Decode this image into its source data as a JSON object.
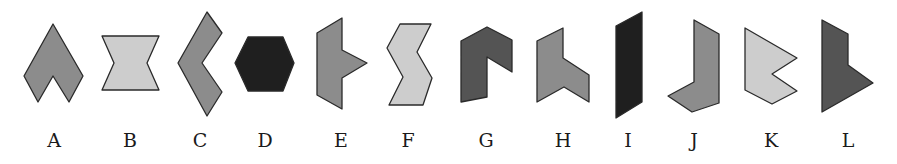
{
  "figure": {
    "title": "",
    "colors": {
      "light": "#cdcdcd",
      "medium": "#8c8c8c",
      "dark": "#545454",
      "black": "#1f1f1f"
    },
    "shapes": [
      {
        "label": "A",
        "fill": "medium",
        "points": "53,24 83,76 69,102 53,76 38,102 24,76",
        "label_x": 54
      },
      {
        "label": "B",
        "fill": "light",
        "points": "102,36 159,36 147,63 159,90 102,90 114,63",
        "label_x": 130
      },
      {
        "label": "C",
        "fill": "medium",
        "points": "207,12 222,33 202,63 222,92 207,116 178,63",
        "label_x": 200
      },
      {
        "label": "D",
        "fill": "black",
        "points": "248,37 283,37 294,63 283,91 248,91 235,63",
        "label_x": 265
      },
      {
        "label": "E",
        "fill": "medium",
        "points": "342,18 342,50 367,63 342,78 342,109 317,95 317,33",
        "label_x": 341
      },
      {
        "label": "F",
        "fill": "light",
        "points": "400,24 431,24 417,52 432,78 423,105 389,105 403,77 387,48",
        "label_x": 408
      },
      {
        "label": "G",
        "fill": "dark",
        "points": "461,41 487,27 512,40 512,72 487,57 487,97 461,102",
        "label_x": 486
      },
      {
        "label": "H",
        "fill": "medium",
        "points": "563,28 563,58 589,75 589,102 564,87 537,102 537,41",
        "label_x": 563
      },
      {
        "label": "I",
        "fill": "black",
        "points": "616,26 642,12 642,102 616,118",
        "label_x": 628
      },
      {
        "label": "J",
        "fill": "medium",
        "points": "694,20 719,34 719,103 692,112 668,96 694,82",
        "label_x": 694
      },
      {
        "label": "K",
        "fill": "light",
        "points": "745,28 797,58 772,74 797,91 772,104 745,90",
        "label_x": 771
      },
      {
        "label": "L",
        "fill": "dark",
        "points": "822,20 848,34 848,65 873,83 822,112",
        "label_x": 848
      }
    ],
    "label_y": 147
  }
}
